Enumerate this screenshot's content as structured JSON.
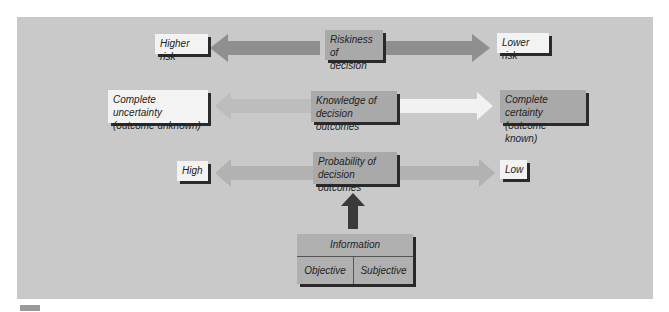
{
  "diagram": {
    "rows": [
      {
        "center": "Riskiness of\ndecision",
        "center_lines": [
          "Riskiness of",
          "decision"
        ],
        "left": "Higher risk",
        "left_lines": [
          "Higher risk"
        ],
        "right": "Lower risk",
        "right_lines": [
          "Lower risk"
        ],
        "left_arrow_color": "#8f8f8f",
        "right_arrow_color": "#8f8f8f"
      },
      {
        "center": "Knowledge of\ndecision outcomes",
        "center_lines": [
          "Knowledge of",
          "decision outcomes"
        ],
        "left": "Complete uncertainty\n(outcome unknown)",
        "left_lines": [
          "Complete uncertainty",
          "(outcome unknown)"
        ],
        "right": "Complete certainty\n(outcome known)",
        "right_lines": [
          "Complete certainty",
          "(outcome known)"
        ],
        "left_arrow_color": "#bdbdbd",
        "right_arrow_color": "#f2f2f2"
      },
      {
        "center": "Probability of\ndecision outcomes",
        "center_lines": [
          "Probability of",
          "decision outcomes"
        ],
        "left": "High",
        "left_lines": [
          "High"
        ],
        "right": "Low",
        "right_lines": [
          "Low"
        ],
        "left_arrow_color": "#b2b2b2",
        "right_arrow_color": "#b2b2b2"
      }
    ],
    "information": {
      "title": "Information",
      "cells": [
        "Objective",
        "Subjective"
      ]
    },
    "colors": {
      "background": "#c9c9c9",
      "light_box": "#f3f3f3",
      "mid_box": "#a9a9a9",
      "shadow": "#2a2a2a",
      "up_arrow": "#3a3a3a"
    }
  }
}
